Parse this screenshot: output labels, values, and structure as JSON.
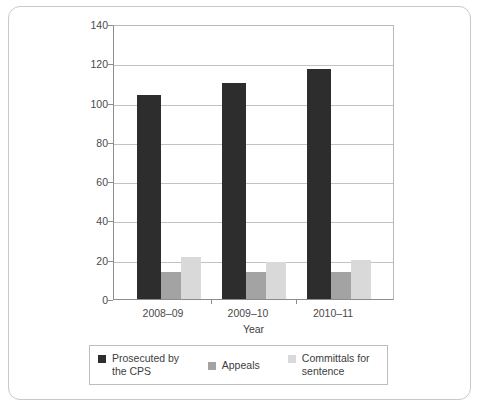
{
  "chart_data": {
    "type": "bar",
    "title": "",
    "subtitle": "",
    "xlabel": "Year",
    "ylabel": "Number of Cases (thousands)",
    "categories": [
      "2008–09",
      "2009–10",
      "2010–11"
    ],
    "series": [
      {
        "name": "Prosecuted by the CPS",
        "values": [
          104,
          110,
          117
        ],
        "color": "#2d2d2d"
      },
      {
        "name": "Appeals",
        "values": [
          14,
          14,
          14
        ],
        "color": "#a3a3a3"
      },
      {
        "name": "Committals for sentence",
        "values": [
          21.5,
          19,
          20
        ],
        "color": "#d9d9d9"
      }
    ],
    "ylim": [
      0,
      140
    ],
    "yticks": [
      0,
      20,
      40,
      60,
      80,
      100,
      120,
      140
    ],
    "ytick_labels": [
      "0",
      "20",
      "40",
      "60",
      "80",
      "100",
      "120",
      "140"
    ],
    "grid": true,
    "grid_axis": "y",
    "legend_position": "bottom"
  },
  "legend": {
    "entries": [
      {
        "label_line1": "Prosecuted by",
        "label_line2": "the CPS"
      },
      {
        "label_line1": "Appeals",
        "label_line2": ""
      },
      {
        "label_line1": "Committals for",
        "label_line2": "sentence"
      }
    ]
  }
}
